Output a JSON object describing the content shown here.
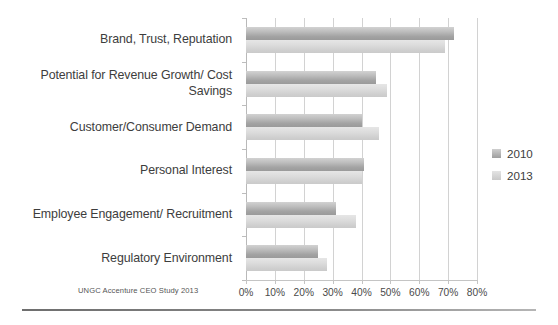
{
  "source_note": "UNGC Accenture CEO Study 2013",
  "legend": {
    "position": "right",
    "items": [
      {
        "label": "2010",
        "color": "#a8a8a8"
      },
      {
        "label": "2013",
        "color": "#d6d6d6"
      }
    ]
  },
  "axis": {
    "ticks": [
      "0%",
      "10%",
      "20%",
      "30%",
      "40%",
      "50%",
      "60%",
      "70%",
      "80%"
    ]
  },
  "chart_data": {
    "type": "bar",
    "orientation": "horizontal",
    "title": "",
    "subtitle": "",
    "xlabel": "",
    "ylabel": "",
    "xlim": [
      0,
      80
    ],
    "xtick_labels": [
      "0%",
      "10%",
      "20%",
      "30%",
      "40%",
      "50%",
      "60%",
      "70%",
      "80%"
    ],
    "xtick_values": [
      0,
      10,
      20,
      30,
      40,
      50,
      60,
      70,
      80
    ],
    "grid": true,
    "grid_axis": "x",
    "legend_position": "right",
    "categories": [
      "Brand, Trust, Reputation",
      "Potential for Revenue Growth/ Cost Savings",
      "Customer/Consumer Demand",
      "Personal Interest",
      "Employee Engagement/ Recruitment",
      "Regulatory Environment"
    ],
    "series": [
      {
        "name": "2010",
        "color": "#a8a8a8",
        "values": [
          72,
          45,
          40,
          41,
          31,
          25
        ]
      },
      {
        "name": "2013",
        "color": "#d6d6d6",
        "values": [
          69,
          49,
          46,
          40,
          38,
          28
        ]
      }
    ],
    "annotations": [
      "UNGC Accenture CEO Study 2013"
    ]
  }
}
